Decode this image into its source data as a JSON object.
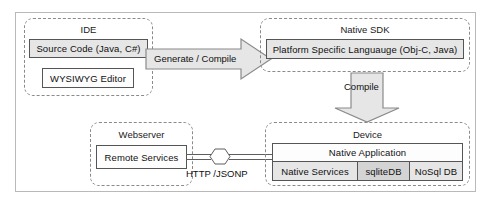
{
  "diagram": {
    "colors": {
      "frame_border": "#b9b9b9",
      "group_border": "#8a8a8a",
      "box_border": "#555555",
      "box_fill_gray": "#e6e6e6",
      "box_fill_gray_dark": "#d4d4d4",
      "box_fill_white": "#fdfdfd",
      "arrow_fill": "#e6e6e6",
      "arrow_border": "#8a8a8a",
      "connector_line": "#5e5e5e",
      "text": "#101010"
    }
  },
  "groups": {
    "ide": {
      "title": "IDE",
      "boxes": [
        {
          "label": "Source Code (Java, C#)"
        },
        {
          "label": "WYSIWYG Editor"
        }
      ]
    },
    "native_sdk": {
      "title": "Native SDK",
      "boxes": [
        {
          "label": "Platform Specific Languauge (Obj-C, Java)"
        }
      ]
    },
    "webserver": {
      "title": "Webserver",
      "boxes": [
        {
          "label": "Remote Services"
        }
      ]
    },
    "device": {
      "title": "Device",
      "boxes": [
        {
          "label": "Native Application"
        },
        {
          "label": "Native Services"
        },
        {
          "label": "sqliteDB"
        },
        {
          "label": "NoSql DB"
        }
      ]
    }
  },
  "arrows": [
    {
      "name": "generate-compile-arrow",
      "label": "Generate / Compile",
      "direction": "right"
    },
    {
      "name": "compile-arrow",
      "label": "Compile",
      "direction": "down"
    }
  ],
  "connector": {
    "label": "HTTP /JSONP",
    "shape": "hexagon"
  }
}
